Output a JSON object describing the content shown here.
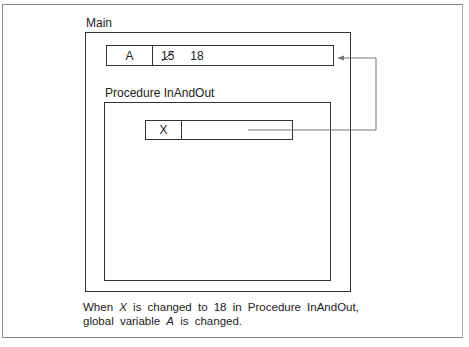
{
  "main": {
    "label": "Main",
    "variable": {
      "name": "A",
      "old_value": "15",
      "new_value": "18"
    }
  },
  "procedure": {
    "label": "Procedure InAndOut",
    "parameter": {
      "name": "X",
      "value": ""
    }
  },
  "connector": {
    "from": "X",
    "to": "A",
    "icon": "arrow-left-icon"
  },
  "caption": {
    "line1_pre": "When ",
    "line1_var": "X",
    "line1_post": " is changed to 18 in Procedure InAndOut,",
    "line2_pre": "global variable ",
    "line2_var": "A",
    "line2_post": " is changed."
  }
}
